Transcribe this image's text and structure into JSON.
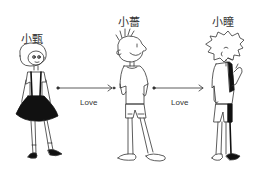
{
  "diagram": {
    "type": "relationship",
    "characters": [
      {
        "id": "left",
        "name": "小甄",
        "description": "girl with bob hair, black skirt, suspenders"
      },
      {
        "id": "middle",
        "name": "小薔",
        "description": "boy with spiky hair, t-shirt, shorts, sandals"
      },
      {
        "id": "right",
        "name": "小瞳",
        "description": "boy with messy hair, t-shirt, shorts"
      }
    ],
    "edges": [
      {
        "from": "left",
        "to": "middle",
        "label": "Love"
      },
      {
        "from": "middle",
        "to": "right",
        "label": "Love"
      }
    ],
    "colors": {
      "line": "#333333",
      "fill": "#111111",
      "background": "#ffffff"
    }
  }
}
